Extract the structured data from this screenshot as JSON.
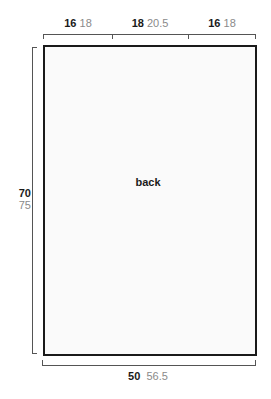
{
  "diagram": {
    "type": "garment schematic",
    "piece": {
      "label": "back"
    },
    "top_measurements": [
      {
        "primary": "16",
        "secondary": "18"
      },
      {
        "primary": "18",
        "secondary": "20.5"
      },
      {
        "primary": "16",
        "secondary": "18"
      }
    ],
    "height": {
      "primary": "70",
      "secondary": "75"
    },
    "width": {
      "primary": "50",
      "secondary": "56.5"
    },
    "colors": {
      "outline": "#1a1a1a",
      "dimension_line": "#555555",
      "secondary_text": "#8a8a8a",
      "fill": "#fafafa"
    }
  }
}
